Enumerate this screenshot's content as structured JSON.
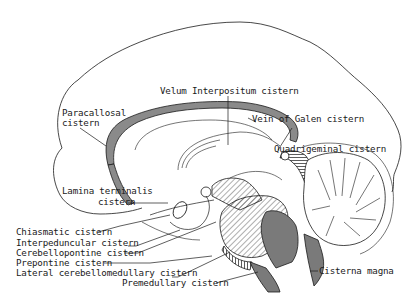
{
  "diagram": {
    "type": "anatomical-sagittal-section",
    "colors": {
      "line": "#1a1a1a",
      "shade": "#7a7a7a",
      "hatch": "#333333",
      "background": "#ffffff"
    },
    "labels": {
      "velum_interpositum": "Velum  Interpositum  cistern",
      "paracallosal_1": "Paracallosal",
      "paracallosal_2": "cistern",
      "vein_of_galen": "Vein of  Galen  cistern",
      "quadrigeminal": "Quadrigeminal  cistern",
      "lamina_terminalis_1": "Lamina  terminalis",
      "lamina_terminalis_2": "cistern",
      "chiasmatic": "Chiasmatic  cistern",
      "interpeduncular": "Interpeduncular  cistern",
      "cerebellopontine": "Cerebellopontine  cistern",
      "prepontine": "Prepontine  cistern",
      "lateral_cerebellomedullary": "Lateral  cerebellomedullary  cistern",
      "premedullary": "Premedullary  cistern",
      "cisterna_magna": "Cisterna  magna"
    }
  }
}
